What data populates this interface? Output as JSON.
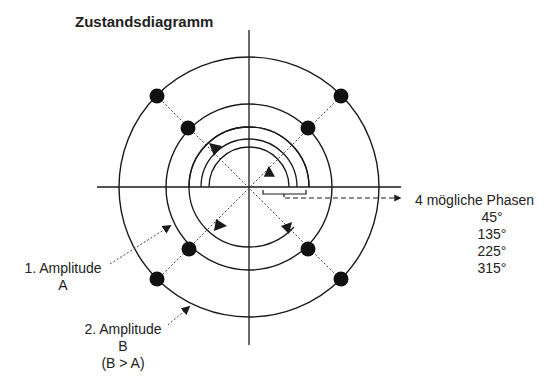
{
  "title": "Zustandsdiagramm",
  "phases": {
    "label": "4 mögliche Phasen",
    "values": [
      "45°",
      "135°",
      "225°",
      "315°"
    ]
  },
  "amplitude1": {
    "line1": "1. Amplitude",
    "line2": "A"
  },
  "amplitude2": {
    "line1": "2. Amplitude",
    "line2": "B",
    "line3": "(B > A)"
  },
  "geometry": {
    "center": [
      249,
      187
    ],
    "outer_radius": 130,
    "inner_radius": 83,
    "phase_angles_deg": [
      45,
      135,
      225,
      315
    ]
  },
  "colors": {
    "line": "#1a1a1a",
    "dot": "#111111",
    "background": "#ffffff"
  }
}
